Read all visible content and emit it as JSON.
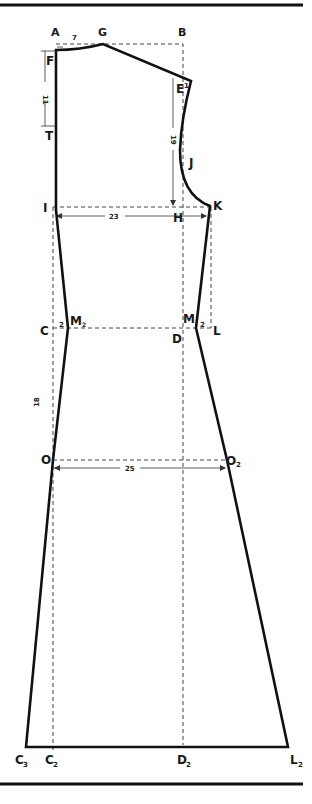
{
  "diagram": {
    "type": "sewing-pattern-draft",
    "colors": {
      "ink": "#111111",
      "background": "#ffffff",
      "guide": "#444444"
    },
    "points": {
      "A": "A",
      "G": "G",
      "B": "B",
      "F": "F",
      "E": "E",
      "T": "T",
      "J": "J",
      "I": "I",
      "H": "H",
      "K": "K",
      "C": "C",
      "M2": "M",
      "M2_sub": "2",
      "M": "M",
      "D": "D",
      "L": "L",
      "O": "O",
      "O2": "O",
      "O2_sub": "2",
      "C3": "C",
      "C3_sub": "3",
      "C2": "C",
      "C2_sub": "2",
      "D2": "D",
      "D2_sub": "2",
      "L2": "L",
      "L2_sub": "2"
    },
    "dimensions": {
      "AG": "7",
      "E_offset": "1",
      "FT": "11",
      "EH": "19",
      "IK": "23",
      "CM2": "2",
      "ML": "2",
      "CO": "18",
      "OO2": "25"
    }
  }
}
